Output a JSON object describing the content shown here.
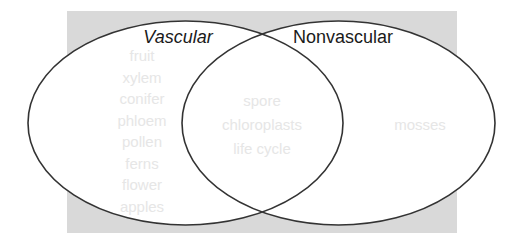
{
  "diagram": {
    "type": "venn",
    "colors": {
      "background_panel": "#d9d9d9",
      "ellipse_fill": "#ffffff",
      "ellipse_stroke": "#333333",
      "title_text": "#1a1a1a",
      "item_text": "#e6e6e6"
    },
    "left_set": {
      "title": "Vascular",
      "items": [
        "fruit",
        "xylem",
        "conifer",
        "phloem",
        "pollen",
        "ferns",
        "flower",
        "apples"
      ]
    },
    "right_set": {
      "title": "Nonvascular",
      "items": [
        "mosses"
      ]
    },
    "intersection": {
      "items": [
        "spore",
        "chloroplasts",
        "life cycle"
      ]
    }
  }
}
